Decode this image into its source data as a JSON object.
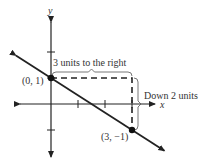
{
  "chart_data": {
    "type": "line",
    "title": "",
    "xlabel": "x",
    "ylabel": "y",
    "xlim": [
      -3.4,
      4.0
    ],
    "ylim": [
      -2.0,
      3.0
    ],
    "grid": false,
    "x_ticks": [
      1,
      2,
      3
    ],
    "y_ticks": [
      2,
      1,
      -1
    ],
    "series": [
      {
        "name": "line",
        "slope": -0.6667,
        "intercept": 1,
        "x_range": [
          -1.3,
          4.2
        ]
      }
    ],
    "points": [
      {
        "x": 0,
        "y": 1,
        "label": "(0, 1)"
      },
      {
        "x": 3,
        "y": -1,
        "label": "(3, −1)"
      }
    ],
    "annotations": {
      "run_label": "3 units to the right",
      "rise_label": "Down 2 units"
    }
  }
}
